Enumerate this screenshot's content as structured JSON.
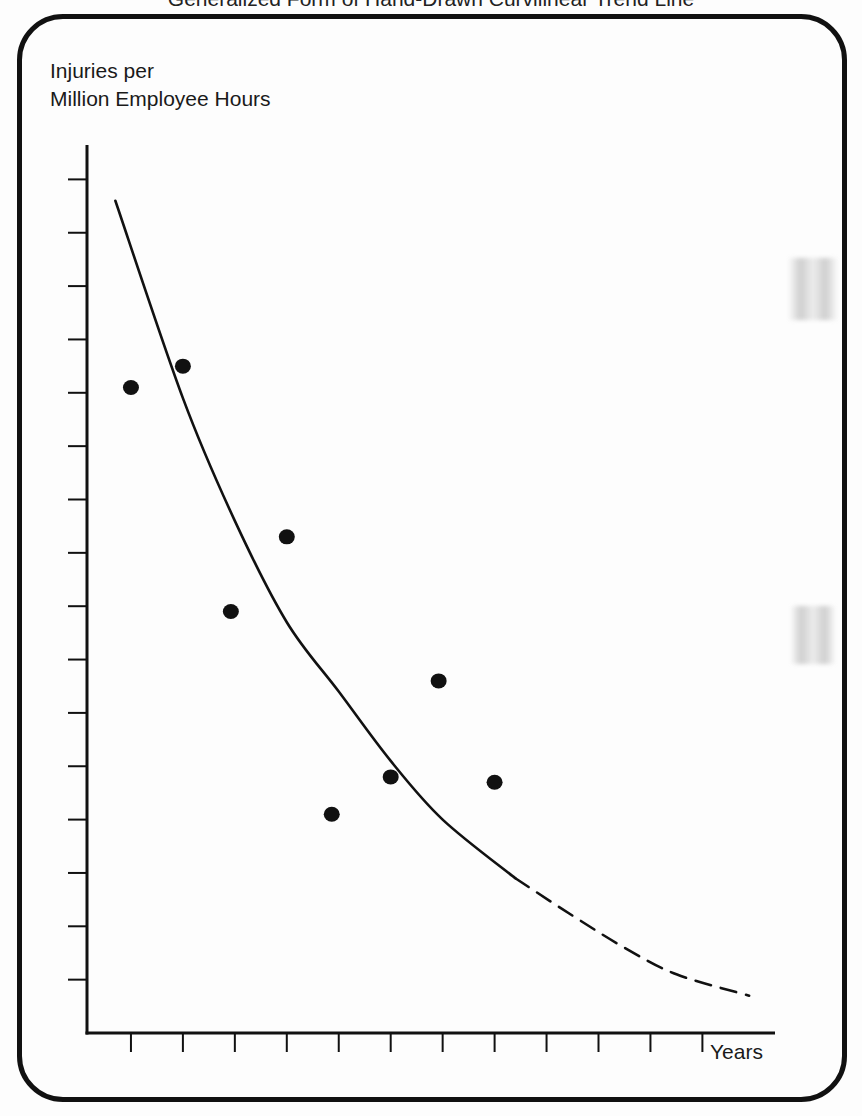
{
  "caption": "Generalized Form of Hand-Drawn Curvilinear Trend Line",
  "y_axis_label_line1": "Injuries per",
  "y_axis_label_line2": "Million Employee Hours",
  "x_axis_label": "Years",
  "colors": {
    "ink": "#111111",
    "background": "#fdfdfd",
    "frame": "#111111"
  },
  "chart_data": {
    "type": "scatter",
    "title": "Generalized Form of Hand-Drawn Curvilinear Trend Line",
    "xlabel": "Years",
    "ylabel": "Injuries per Million Employee Hours",
    "x_ticks": 12,
    "y_ticks": 16,
    "tick_labels_shown": false,
    "grid": false,
    "legend": null,
    "xlim": [
      0,
      12.5
    ],
    "ylim": [
      0,
      17
    ],
    "series": [
      {
        "name": "Observed injury rate",
        "kind": "points",
        "x": [
          1,
          2,
          3,
          4,
          5,
          6,
          7,
          8
        ],
        "y": [
          12.1,
          12.5,
          7.9,
          9.3,
          4.1,
          4.8,
          6.6,
          4.7
        ]
      },
      {
        "name": "Hand-drawn curvilinear trend line",
        "kind": "curve",
        "style": "solid",
        "x": [
          0.7,
          2.0,
          3.0,
          4.0,
          5.0,
          6.0,
          7.0,
          8.4
        ],
        "y": [
          15.6,
          11.9,
          9.6,
          7.7,
          6.4,
          5.1,
          4.0,
          2.9
        ]
      },
      {
        "name": "Projected trend (extrapolation)",
        "kind": "curve",
        "style": "dashed",
        "x": [
          8.4,
          9.5,
          10.5,
          11.5,
          12.9
        ],
        "y": [
          2.9,
          2.2,
          1.6,
          1.1,
          0.7
        ]
      }
    ],
    "annotations": []
  }
}
